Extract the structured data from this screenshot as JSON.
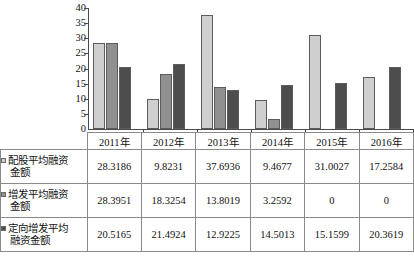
{
  "chart_data": {
    "type": "bar",
    "title": "",
    "xlabel": "",
    "ylabel": "",
    "grid": false,
    "legend_position": "table-left",
    "categories": [
      "2011年",
      "2012年",
      "2013年",
      "2014年",
      "2015年",
      "2016年"
    ],
    "ylim": [
      0,
      40
    ],
    "yticks": [
      0,
      5,
      10,
      15,
      20,
      25,
      30,
      35,
      40
    ],
    "ytick_labels": [
      "0",
      "5",
      "10",
      "15",
      "20",
      "25",
      "30",
      "35",
      "40"
    ],
    "series": [
      {
        "name": "配股平均融资金额",
        "color": "#cfcfcf",
        "values": [
          28.3186,
          9.8231,
          37.6936,
          9.4677,
          31.0027,
          17.2584
        ],
        "value_labels": [
          "28.3186",
          "9.8231",
          "37.6936",
          "9.4677",
          "31.0027",
          "17.2584"
        ]
      },
      {
        "name": "增发平均融资金额",
        "color": "#909090",
        "values": [
          28.3951,
          18.3254,
          13.8019,
          3.2592,
          0,
          0
        ],
        "value_labels": [
          "28.3951",
          "18.3254",
          "13.8019",
          "3.2592",
          "0",
          "0"
        ]
      },
      {
        "name": "定向增发平均融资金额",
        "color": "#4d4d4d",
        "values": [
          20.5165,
          21.4924,
          12.9225,
          14.5013,
          15.1599,
          20.3619
        ],
        "value_labels": [
          "20.5165",
          "21.4924",
          "12.9225",
          "14.5013",
          "15.1599",
          "20.3619"
        ]
      }
    ]
  },
  "table": {
    "header": [
      "2011年",
      "2012年",
      "2013年",
      "2014年",
      "2015年",
      "2016年"
    ],
    "rows": [
      {
        "label": "配股平均融资\n金额",
        "label_line1": "配股平均融资",
        "label_line2": "金额",
        "swatch": "series-0-swatch",
        "values": [
          "28.3186",
          "9.8231",
          "37.6936",
          "9.4677",
          "31.0027",
          "17.2584"
        ]
      },
      {
        "label": "增发平均融资\n金额",
        "label_line1": "增发平均融资",
        "label_line2": "金额",
        "swatch": "series-1-swatch",
        "values": [
          "28.3951",
          "18.3254",
          "13.8019",
          "3.2592",
          "0",
          "0"
        ]
      },
      {
        "label": "定向增发平均\n融资金额",
        "label_line1": "定向增发平均",
        "label_line2": "融资金额",
        "swatch": "series-2-swatch",
        "values": [
          "20.5165",
          "21.4924",
          "12.9225",
          "14.5013",
          "15.1599",
          "20.3619"
        ]
      }
    ]
  }
}
